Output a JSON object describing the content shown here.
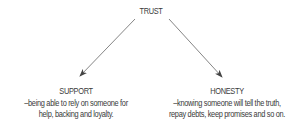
{
  "diagram": {
    "root": {
      "label": "TRUST"
    },
    "branches": [
      {
        "title": "SUPPORT",
        "description_lines": [
          "–being able to rely on someone for",
          "help, backing and loyalty."
        ]
      },
      {
        "title": "HONESTY",
        "description_lines": [
          "–knowing someone will tell the truth,",
          "repay debts, keep promises and so on."
        ]
      }
    ],
    "edges": [
      {
        "from": "TRUST",
        "to": "SUPPORT"
      },
      {
        "from": "TRUST",
        "to": "HONESTY"
      }
    ],
    "colors": {
      "text": "#3a3a3a",
      "arrow": "#555555",
      "background": "#ffffff"
    }
  }
}
